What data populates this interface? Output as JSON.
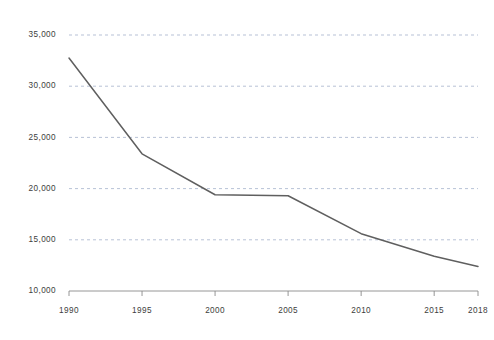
{
  "chart_data": {
    "type": "line",
    "title": "",
    "subtitle": "",
    "xlabel": "",
    "ylabel": "",
    "x": [
      1990,
      1995,
      2000,
      2005,
      2010,
      2015,
      2018
    ],
    "series": [
      {
        "name": "",
        "values": [
          32750,
          23400,
          19400,
          19300,
          15600,
          13400,
          12400
        ]
      }
    ],
    "xlim": [
      1990,
      2018
    ],
    "ylim": [
      10000,
      35000
    ],
    "xticks": [
      1990,
      1995,
      2000,
      2005,
      2010,
      2015,
      2018
    ],
    "xtick_labels": [
      "1990",
      "1995",
      "2000",
      "2005",
      "2010",
      "2015",
      "2018"
    ],
    "yticks": [
      10000,
      15000,
      20000,
      25000,
      30000,
      35000
    ],
    "ytick_labels": [
      "10,000",
      "15,000",
      "20,000",
      "25,000",
      "30,000",
      "35,000"
    ],
    "grid": {
      "horizontal": true,
      "vertical": false,
      "style": "dashed",
      "color": "#9aa8c4"
    },
    "legend": {
      "visible": false,
      "position": "none",
      "entries": []
    },
    "annotations": [],
    "line_color": "#5f5f5f",
    "axis_color": "#8a8a8a",
    "label_color": "#3d3d3d",
    "background_color": "#ffffff"
  }
}
